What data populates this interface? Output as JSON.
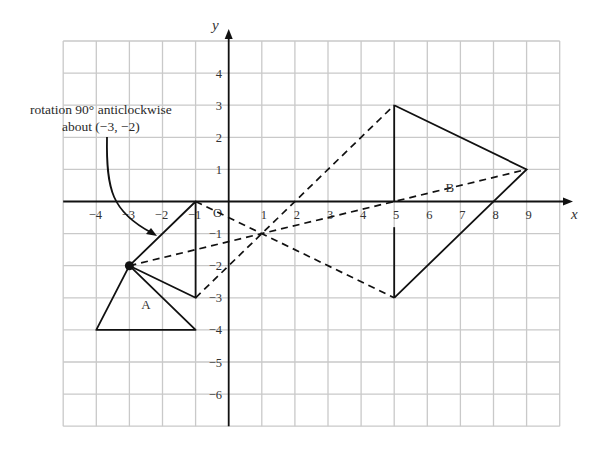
{
  "diagram": {
    "type": "coordinate-grid-transformations",
    "axes": {
      "x_label": "x",
      "y_label": "y",
      "origin_label": "O",
      "x_range": [
        -5,
        10
      ],
      "y_range": [
        -7,
        5
      ],
      "x_ticks": [
        -4,
        -3,
        -2,
        -1,
        1,
        2,
        3,
        4,
        5,
        6,
        7,
        8,
        9
      ],
      "y_ticks": [
        4,
        3,
        2,
        1,
        -1,
        -2,
        -3,
        -4,
        -5,
        -6
      ]
    },
    "annotation": {
      "line1": "rotation 90° anticlockwise",
      "line2": "about (−3, −2)",
      "centre_of_rotation": [
        -3,
        -2
      ]
    },
    "shapes": [
      {
        "name": "A",
        "label_pos": [
          -2.5,
          -3.35
        ],
        "vertices": [
          [
            -4,
            -4
          ],
          [
            -3,
            -2
          ],
          [
            -1,
            -4
          ]
        ],
        "style": "solid"
      },
      {
        "name": "rotated-image",
        "label_pos": null,
        "vertices": [
          [
            -3,
            -2
          ],
          [
            -1,
            0
          ],
          [
            -1,
            -3
          ]
        ],
        "style": "solid"
      },
      {
        "name": "B",
        "label_pos": [
          6.5,
          0.3
        ],
        "vertices": [
          [
            5,
            3
          ],
          [
            9,
            1
          ],
          [
            5,
            -3
          ]
        ],
        "style": "solid"
      }
    ],
    "dashed_rays": [
      {
        "from": [
          -3,
          -2
        ],
        "to": [
          9,
          1
        ]
      },
      {
        "from": [
          -1,
          0
        ],
        "to": [
          5,
          -3
        ]
      },
      {
        "from": [
          -1,
          -3
        ],
        "to": [
          5,
          3
        ]
      }
    ],
    "centre_of_enlargement": [
      1,
      -1
    ],
    "colors": {
      "grid": "#c9c9c9",
      "ink": "#111111",
      "background": "#ffffff"
    }
  }
}
